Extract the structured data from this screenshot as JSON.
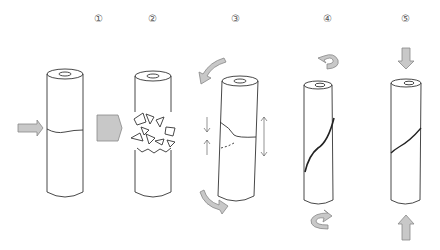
{
  "diagram": {
    "steps": [
      {
        "label": "①",
        "description": "Lateral force applied to cylinder with circumferential crack",
        "arrow": "horizontal-arrow-icon"
      },
      {
        "label": "②",
        "description": "Impact causes fragmentation at the break",
        "arrow": "large-horizontal-arrow-icon"
      },
      {
        "label": "③",
        "description": "Torsion with axial compression and tension causing angled crack",
        "arrow": "curved-torsion-arrows-icon"
      },
      {
        "label": "④",
        "description": "Twisting produces spiral fracture",
        "arrow": "twist-arrows-icon"
      },
      {
        "label": "⑤",
        "description": "Axial compression producing oblique fracture",
        "arrow": "vertical-compression-arrows-icon"
      }
    ],
    "colors": {
      "line": "#333333",
      "arrow_fill": "#c8c8c8",
      "arrow_stroke": "#888888",
      "label": "#555555"
    }
  }
}
